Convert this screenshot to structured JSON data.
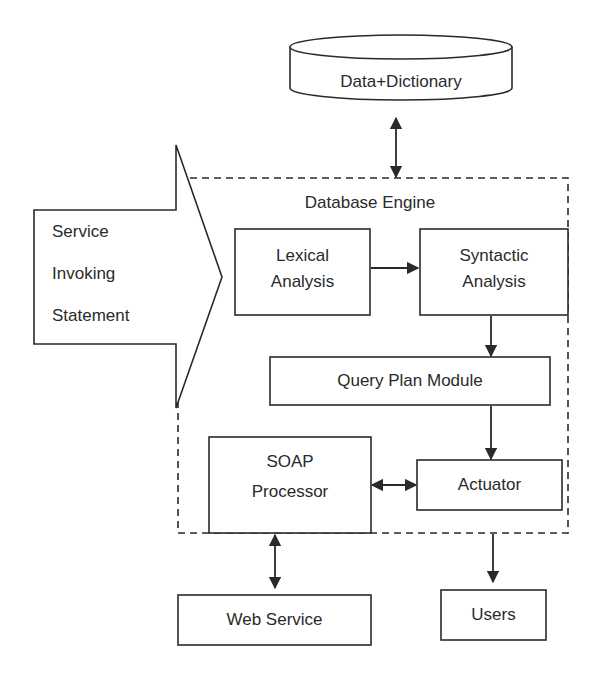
{
  "diagram": {
    "nodes": {
      "data_dictionary": {
        "label": "Data+Dictionary",
        "shape": "cylinder"
      },
      "service_statement": {
        "line1": "Service",
        "line2": "Invoking",
        "line3": "Statement",
        "shape": "block-arrow"
      },
      "database_engine": {
        "label": "Database Engine",
        "shape": "dashed-container"
      },
      "lexical": {
        "line1": "Lexical",
        "line2": "Analysis"
      },
      "syntactic": {
        "line1": "Syntactic",
        "line2": "Analysis"
      },
      "query_plan": {
        "label": "Query Plan Module"
      },
      "soap": {
        "line1": "SOAP",
        "line2": "Processor"
      },
      "actuator": {
        "label": "Actuator"
      },
      "web_service": {
        "label": "Web Service"
      },
      "users": {
        "label": "Users"
      }
    },
    "edges": [
      {
        "from": "data_dictionary",
        "to": "database_engine",
        "type": "bidirectional"
      },
      {
        "from": "service_statement",
        "to": "database_engine",
        "type": "block-arrow"
      },
      {
        "from": "lexical",
        "to": "syntactic",
        "type": "directed"
      },
      {
        "from": "syntactic",
        "to": "query_plan",
        "type": "directed"
      },
      {
        "from": "query_plan",
        "to": "actuator",
        "type": "directed"
      },
      {
        "from": "soap",
        "to": "actuator",
        "type": "bidirectional"
      },
      {
        "from": "soap",
        "to": "web_service",
        "type": "bidirectional"
      },
      {
        "from": "database_engine",
        "to": "users",
        "type": "directed"
      }
    ],
    "colors": {
      "stroke": "#2a2a2a",
      "background": "#ffffff"
    }
  }
}
